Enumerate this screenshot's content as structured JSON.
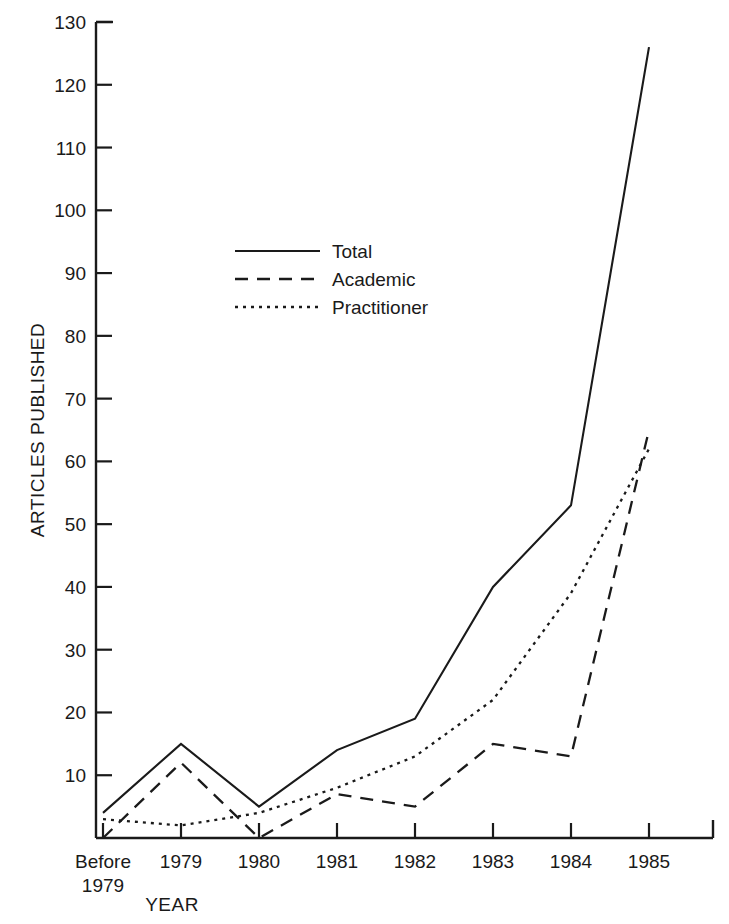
{
  "chart_data": {
    "type": "line",
    "title": "",
    "xlabel": "YEAR",
    "ylabel": "ARTICLES PUBLISHED",
    "categories": [
      "Before 1979",
      "1979",
      "1980",
      "1981",
      "1982",
      "1983",
      "1984",
      "1985"
    ],
    "category_labels_line1": [
      "Before",
      "1979",
      "1980",
      "1981",
      "1982",
      "1983",
      "1984",
      "1985"
    ],
    "category_labels_line2": [
      "1979",
      "",
      "",
      "",
      "",
      "",
      "",
      ""
    ],
    "ylim": [
      0,
      130
    ],
    "yticks": [
      0,
      10,
      20,
      30,
      40,
      50,
      60,
      70,
      80,
      90,
      100,
      110,
      120,
      130
    ],
    "ytick_labels": [
      "",
      "10",
      "20",
      "30",
      "40",
      "50",
      "60",
      "70",
      "80",
      "90",
      "100",
      "110",
      "120",
      "130"
    ],
    "grid": false,
    "legend_position": "upper-center-left",
    "series": [
      {
        "name": "Total",
        "style": "solid",
        "values": [
          4,
          15,
          5,
          14,
          19,
          40,
          53,
          126
        ]
      },
      {
        "name": "Academic",
        "style": "dashed",
        "values": [
          0,
          12,
          0,
          7,
          5,
          15,
          13,
          65
        ]
      },
      {
        "name": "Practitioner",
        "style": "dotted",
        "values": [
          3,
          2,
          4,
          8,
          13,
          22,
          39,
          62
        ]
      }
    ]
  },
  "legend": {
    "items": [
      {
        "label": "Total",
        "style": "solid"
      },
      {
        "label": "Academic",
        "style": "dashed"
      },
      {
        "label": "Practitioner",
        "style": "dotted"
      }
    ]
  },
  "colors": {
    "ink": "#1a1a1a",
    "background": "#ffffff"
  }
}
